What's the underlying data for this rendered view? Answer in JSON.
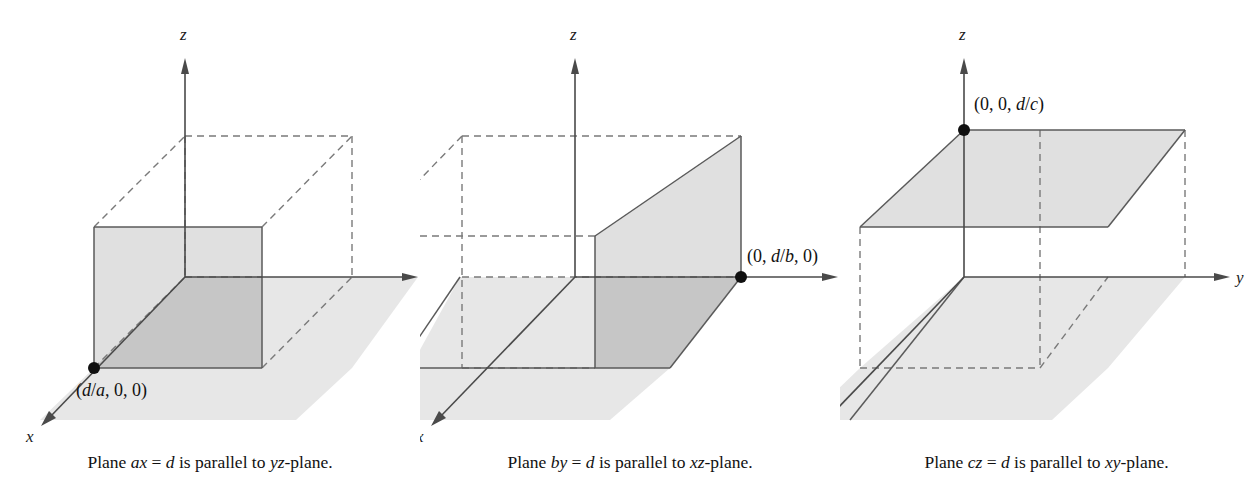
{
  "figure": {
    "title": "",
    "panel_count": 3,
    "colors": {
      "plane_light": "#e7e7e7",
      "plane_mid": "#dcdcdc",
      "plane_dark": "#c6c6c6",
      "stroke": "#5a5a5a",
      "axis": "#4a4a4a",
      "dashed": "#7a7a7a",
      "text": "#111111",
      "background": "#ffffff"
    }
  },
  "panels": [
    {
      "id": "panel-ax",
      "equation": "ax = d",
      "parallel_to": "yz-plane",
      "caption": {
        "prefix": "Plane ",
        "equation_italic_1": "ax",
        "equals": " = ",
        "equation_italic_2": "d",
        "middle": " is parallel to ",
        "plane_italic": "yz",
        "suffix": "-plane."
      },
      "caption_plain": "Plane ax = d is parallel to yz-plane.",
      "axes": {
        "x_label": "x",
        "y_label": "y",
        "z_label": "z"
      },
      "point": {
        "label_plain": "(d/a, 0, 0)",
        "open_paren": "(",
        "italic_num": "d",
        "slash": "/",
        "italic_den": "a",
        "rest": ", 0, 0)",
        "coords": "(d/a, 0, 0)"
      }
    },
    {
      "id": "panel-by",
      "equation": "by = d",
      "parallel_to": "xz-plane",
      "caption": {
        "prefix": "Plane ",
        "equation_italic_1": "by",
        "equals": " = ",
        "equation_italic_2": "d",
        "middle": " is parallel to ",
        "plane_italic": "xz",
        "suffix": "-plane."
      },
      "caption_plain": "Plane by = d is parallel to xz-plane.",
      "axes": {
        "x_label": "x",
        "y_label": "y",
        "z_label": "z"
      },
      "point": {
        "label_plain": "(0, d/b, 0)",
        "open_paren": "(0, ",
        "italic_num": "d",
        "slash": "/",
        "italic_den": "b",
        "rest": ", 0)",
        "coords": "(0, d/b, 0)"
      }
    },
    {
      "id": "panel-cz",
      "equation": "cz = d",
      "parallel_to": "xy-plane",
      "caption": {
        "prefix": "Plane ",
        "equation_italic_1": "cz",
        "equals": " = ",
        "equation_italic_2": "d",
        "middle": " is parallel to ",
        "plane_italic": "xy",
        "suffix": "-plane."
      },
      "caption_plain": "Plane cz = d is parallel to xy-plane.",
      "axes": {
        "x_label": "x",
        "y_label": "y",
        "z_label": "z"
      },
      "point": {
        "label_plain": "(0, 0, d/c)",
        "open_paren": "(0, 0, ",
        "italic_num": "d",
        "slash": "/",
        "italic_den": "c",
        "rest": ")",
        "coords": "(0, 0, d/c)"
      }
    }
  ]
}
